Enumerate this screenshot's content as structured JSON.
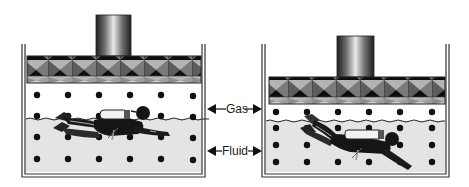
{
  "diagram": {
    "labels": {
      "gas": "Gas",
      "fluid": "Fluid"
    },
    "panels": [
      {
        "id": "left",
        "state": "piston raised",
        "container": {
          "x1": 22,
          "x2": 205,
          "top": 44,
          "bottom": 177
        },
        "piston": {
          "plate_top": 56,
          "plate_bottom": 83,
          "rod_x": 96,
          "rod_w": 35,
          "rod_top": 15
        },
        "fluid_surface_y": 119,
        "dot_columns": [
          37,
          68,
          99,
          130,
          161,
          193
        ],
        "gas_dot_rows": [
          95,
          116
        ],
        "fluid_dot_rows": [
          137,
          159
        ],
        "diver": "horizontal at surface"
      },
      {
        "id": "right",
        "state": "piston lowered (gas compressed)",
        "container": {
          "x1": 262,
          "x2": 449,
          "top": 44,
          "bottom": 177
        },
        "piston": {
          "plate_top": 77,
          "plate_bottom": 104,
          "rod_x": 337,
          "rod_w": 37,
          "rod_top": 36
        },
        "fluid_surface_y": 121,
        "dot_columns": [
          276,
          307,
          338,
          369,
          400,
          432
        ],
        "gas_dot_rows": [
          112
        ],
        "fluid_dot_rows": [
          128,
          145,
          162
        ],
        "diver": "descending below surface"
      }
    ],
    "colors": {
      "wall": "#333333",
      "gas_bg": "#ffffff",
      "fluid_bg": "#e4e4e4",
      "dot": "#111111",
      "piston_dark": "#111111",
      "piston_mid": "#777777",
      "piston_light": "#bdbdbd"
    }
  }
}
